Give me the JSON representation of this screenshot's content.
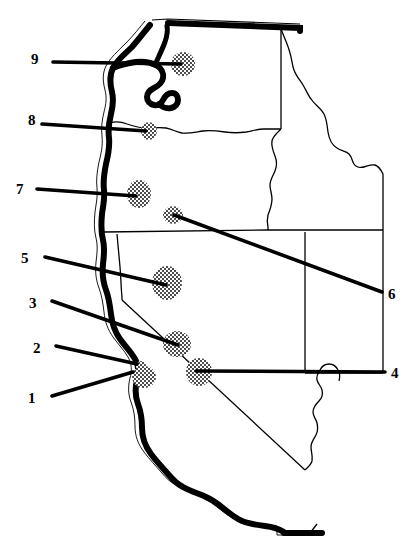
{
  "figure": {
    "kind": "outline-map",
    "region": "Western United States",
    "width": 419,
    "height": 557,
    "background_color": "#ffffff",
    "ink_color": "#000000",
    "coastline_style": "heavy black band with thin white offset line",
    "marker_style": "stippled halftone dot cluster"
  },
  "callouts": [
    {
      "id": "1",
      "label": "1",
      "side": "left",
      "number_x": 28,
      "number_y": 391,
      "line_from": [
        52,
        396
      ],
      "line_to": [
        131,
        371
      ],
      "target_marker": "marker-1"
    },
    {
      "id": "2",
      "label": "2",
      "side": "left",
      "number_x": 33,
      "number_y": 341,
      "line_from": [
        56,
        346
      ],
      "line_to": [
        133,
        363
      ],
      "target_marker": "marker-2"
    },
    {
      "id": "3",
      "label": "3",
      "side": "left",
      "number_x": 29,
      "number_y": 296,
      "line_from": [
        52,
        301
      ],
      "line_to": [
        178,
        345
      ],
      "target_marker": "marker-3"
    },
    {
      "id": "4",
      "label": "4",
      "side": "right",
      "number_x": 391,
      "number_y": 366,
      "line_from": [
        385,
        372
      ],
      "line_to": [
        196,
        371
      ],
      "target_marker": "marker-4"
    },
    {
      "id": "5",
      "label": "5",
      "side": "left",
      "number_x": 21,
      "number_y": 251,
      "line_from": [
        45,
        257
      ],
      "line_to": [
        166,
        285
      ],
      "target_marker": "marker-5"
    },
    {
      "id": "6",
      "label": "6",
      "side": "right",
      "number_x": 388,
      "number_y": 287,
      "line_from": [
        382,
        292
      ],
      "line_to": [
        174,
        215
      ],
      "target_marker": "marker-6"
    },
    {
      "id": "7",
      "label": "7",
      "side": "left",
      "number_x": 16,
      "number_y": 182,
      "line_from": [
        37,
        189
      ],
      "line_to": [
        136,
        196
      ],
      "target_marker": "marker-7"
    },
    {
      "id": "8",
      "label": "8",
      "side": "left",
      "number_x": 28,
      "number_y": 113,
      "line_from": [
        42,
        124
      ],
      "line_to": [
        146,
        131
      ],
      "target_marker": "marker-8"
    },
    {
      "id": "9",
      "label": "9",
      "side": "left",
      "number_x": 31,
      "number_y": 52,
      "line_from": [
        53,
        62
      ],
      "line_to": [
        181,
        64
      ],
      "target_marker": "marker-9"
    }
  ],
  "markers": [
    {
      "id": "marker-1",
      "cx": 144,
      "cy": 377,
      "rx": 12,
      "ry": 11
    },
    {
      "id": "marker-2",
      "cx": 141,
      "cy": 366,
      "rx": 5,
      "ry": 5
    },
    {
      "id": "marker-3",
      "cx": 177,
      "cy": 344,
      "rx": 14,
      "ry": 13
    },
    {
      "id": "marker-4",
      "cx": 199,
      "cy": 372,
      "rx": 13,
      "ry": 14
    },
    {
      "id": "marker-5",
      "cx": 167,
      "cy": 283,
      "rx": 15,
      "ry": 17
    },
    {
      "id": "marker-6",
      "cx": 173,
      "cy": 215,
      "rx": 10,
      "ry": 9
    },
    {
      "id": "marker-7",
      "cx": 139,
      "cy": 194,
      "rx": 12,
      "ry": 14
    },
    {
      "id": "marker-8",
      "cx": 149,
      "cy": 131,
      "rx": 8,
      "ry": 9
    },
    {
      "id": "marker-9",
      "cx": 183,
      "cy": 64,
      "rx": 12,
      "ry": 12
    }
  ]
}
